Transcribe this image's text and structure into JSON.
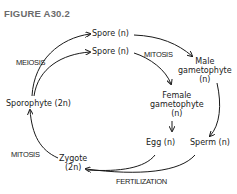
{
  "figure": {
    "title": "FIGURE A30.2"
  },
  "nodes": {
    "spore1": "Spore (n)",
    "spore2": "Spore (n)",
    "male_gametophyte": [
      "Male",
      "gametophyte",
      "(n)"
    ],
    "female_gametophyte": [
      "Female",
      "gametophyte",
      "(n)"
    ],
    "egg": "Egg (n)",
    "sperm": "Sperm (n)",
    "zygote": [
      "Zygote",
      "(2n)"
    ],
    "sporophyte": "Sporophyte (2n)"
  },
  "processes": {
    "meiosis": "MEIOSIS",
    "mitosis_top": "MITOSIS",
    "mitosis_left": "MITOSIS",
    "fertilization": "FERTILIZATION"
  },
  "colors": {
    "title": "#6b6b6b",
    "ink": "#1a1a1a",
    "background": "#ffffff"
  }
}
